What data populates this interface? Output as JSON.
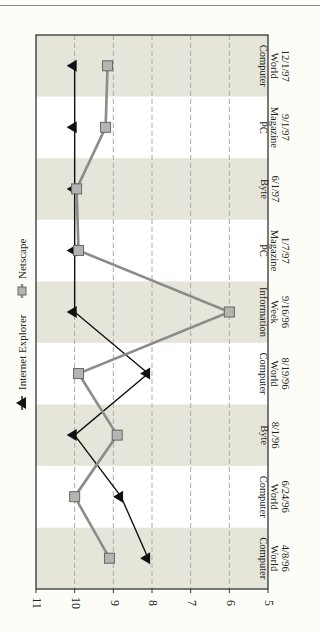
{
  "chart_data": {
    "type": "line",
    "orientation": "rotated-90-clockwise",
    "title": "",
    "xlabel": "",
    "ylabel": "",
    "ylim": [
      5,
      11
    ],
    "yticks": [
      11,
      10,
      9,
      8,
      7,
      6,
      5
    ],
    "grid": true,
    "legend_position": "left (rotated, above plot)",
    "categories": [
      [
        "Computer",
        "World",
        "4/8/96"
      ],
      [
        "Computer",
        "World",
        "6/24/96"
      ],
      [
        "Byte",
        "8/1/96"
      ],
      [
        "Computer",
        "World",
        "8/19/96"
      ],
      [
        "Information",
        "Week",
        "9/16/96"
      ],
      [
        "PC",
        "Magazine",
        "1/7/97"
      ],
      [
        "Byte",
        "6/1/97"
      ],
      [
        "PC",
        "Magazine",
        "9/1/97"
      ],
      [
        "Computer",
        "World",
        "12/1/97"
      ]
    ],
    "series": [
      {
        "name": "Internet Explorer",
        "marker": "triangle",
        "color": "#111111",
        "values": [
          8.1,
          8.8,
          10,
          8.1,
          10,
          10,
          10,
          10,
          10
        ]
      },
      {
        "name": "Netscape",
        "marker": "square",
        "color": "#8c8c88",
        "values": [
          9.1,
          10,
          8.9,
          9.9,
          6,
          9.9,
          9.95,
          9.2,
          9.15
        ]
      }
    ]
  },
  "legend": {
    "items": [
      "Internet Explorer",
      "Netscape"
    ]
  },
  "colors": {
    "band_shaded": "#e6e5da",
    "band_light": "#ffffff",
    "frame": "#333333",
    "grid": "#aaaaaa",
    "ie_line": "#111111",
    "netscape_line": "#8c8c88",
    "netscape_marker": "#b4b4b0"
  }
}
